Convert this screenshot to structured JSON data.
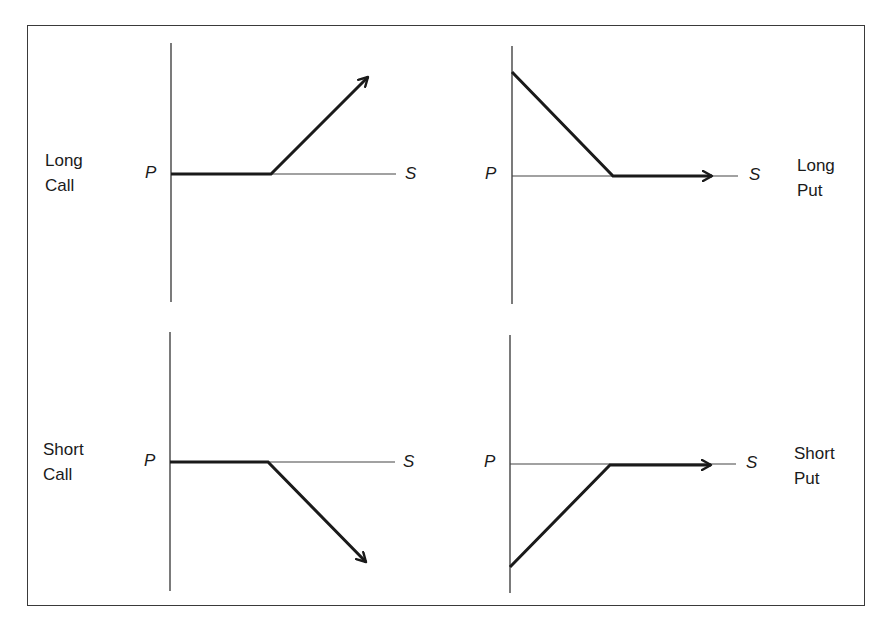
{
  "panels": [
    {
      "id": "long-call",
      "label_line1": "Long",
      "label_line2": "Call",
      "y_axis_label": "P",
      "x_axis_label": "S",
      "payoff": "flat at zero until strike, then rises with slope +1"
    },
    {
      "id": "long-put",
      "label_line1": "Long",
      "label_line2": "Put",
      "y_axis_label": "P",
      "x_axis_label": "S",
      "payoff": "declines with slope -1 until strike, then flat at zero"
    },
    {
      "id": "short-call",
      "label_line1": "Short",
      "label_line2": "Call",
      "y_axis_label": "P",
      "x_axis_label": "S",
      "payoff": "flat at zero until strike, then falls with slope -1"
    },
    {
      "id": "short-put",
      "label_line1": "Short",
      "label_line2": "Put",
      "y_axis_label": "P",
      "x_axis_label": "S",
      "payoff": "rises with slope +1 until strike, then flat at zero"
    }
  ],
  "colors": {
    "line": "#1a1a1a",
    "axis": "#333333",
    "border": "#3a3a3a",
    "background": "#ffffff"
  }
}
